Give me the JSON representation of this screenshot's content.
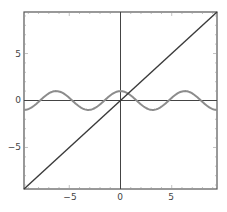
{
  "chart_data": {
    "type": "line",
    "title": "",
    "xlabel": "",
    "ylabel": "",
    "xlim": [
      -9.42,
      9.42
    ],
    "ylim": [
      -9.42,
      9.42
    ],
    "grid": false,
    "legend": null,
    "x_ticks": [
      -5,
      0,
      5
    ],
    "y_ticks": [
      -5,
      0,
      5
    ],
    "x_tick_labels": [
      "−5",
      "0",
      "5"
    ],
    "y_tick_labels": [
      "5",
      "0",
      "−5"
    ],
    "series": [
      {
        "name": "y = x",
        "expression": "x",
        "color": "#3a3a3a",
        "x": [
          -9.42,
          9.42
        ],
        "y": [
          -9.42,
          9.42
        ]
      },
      {
        "name": "y = cos(x)",
        "expression": "cos(x)",
        "color": "#8c8c8c",
        "x": [
          -9.42,
          -6.28,
          -3.14,
          0,
          3.14,
          6.28,
          9.42
        ],
        "y": [
          -1,
          1,
          -1,
          1,
          -1,
          1,
          -1
        ]
      }
    ]
  },
  "axes": {
    "x_labels": [
      {
        "value": -5,
        "text": "−5"
      },
      {
        "value": 0,
        "text": "0"
      },
      {
        "value": 5,
        "text": "5"
      }
    ],
    "y_labels": [
      {
        "value": 5,
        "text": "5"
      },
      {
        "value": 0,
        "text": "0"
      },
      {
        "value": -5,
        "text": "−5"
      }
    ]
  },
  "colors": {
    "frame": "#555555",
    "axis": "#444444",
    "line": "#3a3a3a",
    "cos": "#8c8c8c"
  }
}
